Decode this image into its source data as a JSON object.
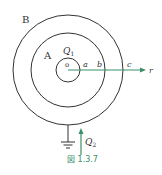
{
  "figure": {
    "caption": "図 1.3.7",
    "labels": {
      "outer_shell": "B",
      "inner_shell": "A",
      "charge_inner": "Q",
      "charge_inner_sub": "1",
      "center": "o",
      "radius_a": "a",
      "radius_b": "b",
      "radius_c": "c",
      "axis_r": "r",
      "charge_ground": "Q",
      "charge_ground_sub": "2"
    },
    "colors": {
      "line": "#333333",
      "accent": "#3a8f6a",
      "caption": "#3a8f6a"
    },
    "geometry": {
      "center": [
        68,
        70
      ],
      "radii": {
        "a": 12,
        "b": 37,
        "c": 55
      }
    }
  }
}
